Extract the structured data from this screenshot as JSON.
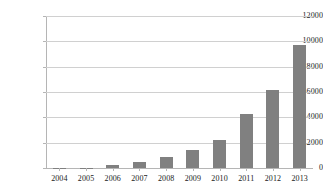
{
  "chart_data": {
    "type": "bar",
    "title": "",
    "subtitle": "",
    "xlabel": "",
    "ylabel": "",
    "categories": [
      "2004",
      "2005",
      "2006",
      "2007",
      "2008",
      "2009",
      "2010",
      "2011",
      "2012",
      "2013"
    ],
    "values": [
      10,
      40,
      220,
      480,
      870,
      1400,
      2250,
      4250,
      6150,
      9750
    ],
    "series": [
      {
        "name": "",
        "values": [
          10,
          40,
          220,
          480,
          870,
          1400,
          2250,
          4250,
          6150,
          9750
        ],
        "color": "#808080"
      }
    ],
    "ylim": [
      0,
      12000
    ],
    "ytick_labels": [
      "0",
      "2000",
      "4000",
      "6000",
      "8000",
      "10000",
      "12000"
    ],
    "ytick_values": [
      0,
      2000,
      4000,
      6000,
      8000,
      10000,
      12000
    ],
    "xtick_labels": [
      "2004",
      "2005",
      "2006",
      "2007",
      "2008",
      "2009",
      "2010",
      "2011",
      "2012",
      "2013"
    ],
    "grid": true,
    "grid_axis": "y",
    "legend": false,
    "legend_position": "none",
    "bar_color": "#808080",
    "gridline_color": "#d0d0d0",
    "axis_color": "#b5b5b5",
    "background_color": "#ffffff",
    "text_color": "#1a1a1a",
    "annotations": []
  }
}
